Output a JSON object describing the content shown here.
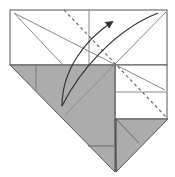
{
  "diagram": {
    "type": "origami-fold-step",
    "colors": {
      "paper_front": "#ffffff",
      "paper_back": "#acacac",
      "outline": "#555555",
      "crease": "#8a8a8a",
      "arrow": "#333333",
      "valley_fold": "#666666"
    },
    "elements": {
      "white_panel": "unfolded white paper region",
      "gray_triangle_left": "folded colored flap",
      "gray_triangle_right": "small folded colored flap",
      "valley_fold_line": "dashed valley fold line",
      "fold_arrow": "curved arrow indicating fold direction"
    }
  }
}
